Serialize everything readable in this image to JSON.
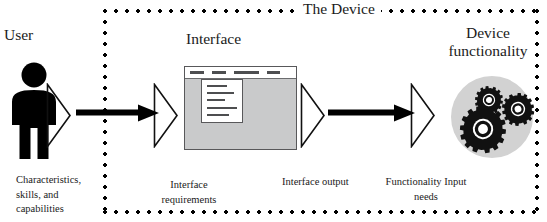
{
  "diagram": {
    "boundary_label": "The Device",
    "headings": {
      "user": "User",
      "interface": "Interface",
      "device_functionality": "Device\nfunctionality"
    },
    "device_functionality_line1": "Device",
    "device_functionality_line2": "functionality",
    "captions": {
      "user_attributes": "Characteristics, skills, and capabilities",
      "interface_requirements": "Interface requirements",
      "interface_output": "Interface output",
      "functionality_input_needs": "Functionality Input needs"
    },
    "icons": {
      "person": "person-icon",
      "window": "interface-window-icon",
      "gears": "gears-icon",
      "funnel": "funnel-triangle-icon",
      "arrow": "right-arrow-icon"
    },
    "window_graphic": {
      "menu_tabs": 4,
      "dropdown_items": 5
    },
    "gear_count": 3,
    "colors": {
      "ink": "#1a1a1a",
      "boundary_dots": "#000000",
      "window_fill": "#c9cacb",
      "window_border": "#58585a",
      "menubar_fill": "#ffffff",
      "gear_disc": "#d2d2d2",
      "gear_body": "#1a1a1a",
      "background": "#ffffff"
    }
  }
}
